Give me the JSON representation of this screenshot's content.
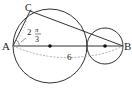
{
  "diagram": {
    "points": {
      "A": {
        "label": "A",
        "x": 13,
        "y": 46
      },
      "B": {
        "label": "B",
        "x": 123,
        "y": 46
      },
      "C": {
        "label": "C",
        "x": 30,
        "y": 11
      }
    },
    "circles": [
      {
        "name": "large-circle",
        "cx": 50,
        "cy": 46,
        "r": 37
      },
      {
        "name": "small-circle",
        "cx": 105,
        "cy": 46,
        "r": 18
      }
    ],
    "angle_label": {
      "coefficient": "2",
      "numerator": "π",
      "denominator": "3"
    },
    "length_label": "6",
    "colors": {
      "stroke": "#333333",
      "dashed": "#999999"
    }
  }
}
